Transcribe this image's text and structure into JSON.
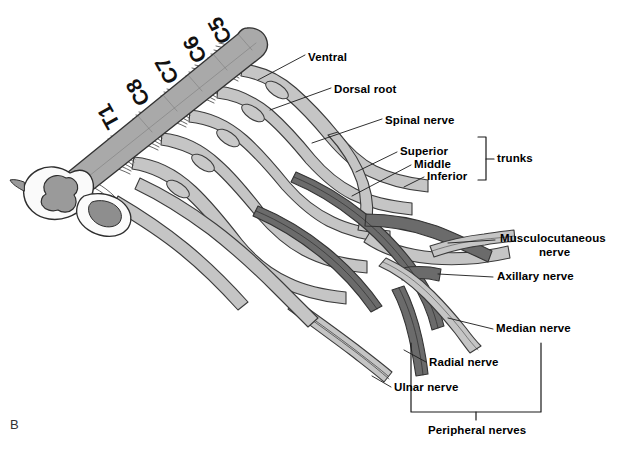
{
  "figure": {
    "letter": "B",
    "background_color": "#ffffff",
    "ink_color": "#000000",
    "cord_fill": "#a9a9a9",
    "nerve_light_fill": "#c5c5c5",
    "nerve_dark_fill": "#6b6b6b",
    "outline_color": "#3b3b3b",
    "width": 621,
    "height": 451
  },
  "cord_segments": [
    {
      "label": "C5",
      "x": 216,
      "y": 48,
      "rotate": -119
    },
    {
      "label": "C6",
      "x": 191,
      "y": 67,
      "rotate": -119
    },
    {
      "label": "C7",
      "x": 163,
      "y": 88,
      "rotate": -119
    },
    {
      "label": "C8",
      "x": 134,
      "y": 110,
      "rotate": -119
    },
    {
      "label": "T1",
      "x": 104,
      "y": 133,
      "rotate": -119
    }
  ],
  "labels": [
    {
      "name": "ventral",
      "text": "Ventral",
      "x": 308,
      "y": 51
    },
    {
      "name": "dorsal-root",
      "text": "Dorsal root",
      "x": 334,
      "y": 83
    },
    {
      "name": "spinal-nerve",
      "text": "Spinal nerve",
      "x": 385,
      "y": 114
    },
    {
      "name": "superior-trunk",
      "text": "Superior",
      "x": 400,
      "y": 148
    },
    {
      "name": "middle-trunk",
      "text": "Middle",
      "x": 414,
      "y": 161
    },
    {
      "name": "inferior-trunk",
      "text": "Inferior",
      "x": 427,
      "y": 173
    },
    {
      "name": "trunks-bracket",
      "text": "trunks",
      "x": 497,
      "y": 159
    },
    {
      "name": "musculocutaneous-nerve-line1",
      "text": "Musculocutaneous",
      "x": 500,
      "y": 235
    },
    {
      "name": "musculocutaneous-nerve-line2",
      "text": "nerve",
      "x": 539,
      "y": 249
    },
    {
      "name": "axillary-nerve",
      "text": "Axillary nerve",
      "x": 497,
      "y": 273
    },
    {
      "name": "median-nerve",
      "text": "Median nerve",
      "x": 496,
      "y": 325
    },
    {
      "name": "radial-nerve",
      "text": "Radial nerve",
      "x": 429,
      "y": 359
    },
    {
      "name": "ulnar-nerve",
      "text": "Ulnar nerve",
      "x": 394,
      "y": 384
    },
    {
      "name": "peripheral-nerves-bracket",
      "text": "Peripheral nerves",
      "x": 428,
      "y": 428
    }
  ]
}
